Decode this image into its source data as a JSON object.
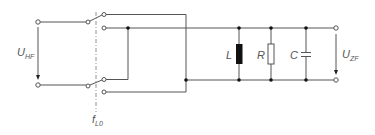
{
  "diagram": {
    "type": "circuit-schematic",
    "title": "",
    "labels": {
      "input_voltage": {
        "main": "U",
        "sub": "HF"
      },
      "output_voltage": {
        "main": "U",
        "sub": "ZF"
      },
      "local_oscillator": {
        "main": "f",
        "sub": "L0"
      },
      "inductor": "L",
      "resistor": "R",
      "capacitor": "C"
    },
    "components": [
      {
        "id": "input-terminals",
        "kind": "terminal-pair",
        "label": "U_HF"
      },
      {
        "id": "switch-upper",
        "kind": "changeover-switch"
      },
      {
        "id": "switch-lower",
        "kind": "changeover-switch"
      },
      {
        "id": "inductor",
        "kind": "inductor",
        "label": "L"
      },
      {
        "id": "resistor",
        "kind": "resistor",
        "label": "R"
      },
      {
        "id": "capacitor",
        "kind": "capacitor",
        "label": "C"
      },
      {
        "id": "output-terminals",
        "kind": "terminal-pair",
        "label": "U_ZF"
      }
    ],
    "colors": {
      "wire": "#555555",
      "dot": "#111111",
      "inductor_fill": "#111111",
      "label": "#555555"
    }
  }
}
